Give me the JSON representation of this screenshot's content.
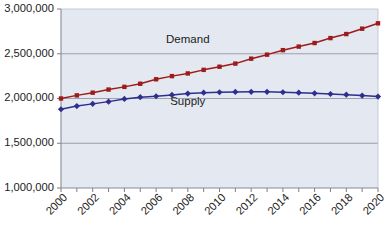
{
  "chart_data": {
    "type": "line",
    "title": "",
    "xlabel": "",
    "ylabel": "",
    "ylim": [
      1000000,
      3000000
    ],
    "xlim": [
      2000,
      2020
    ],
    "grid": true,
    "legend_position": "inline-annotation",
    "y_ticks": [
      1000000,
      1500000,
      2000000,
      2500000,
      3000000
    ],
    "y_tick_labels": [
      "1,000,000",
      "1,500,000",
      "2,000,000",
      "2,500,000",
      "3,000,000"
    ],
    "x": [
      2000,
      2001,
      2002,
      2003,
      2004,
      2005,
      2006,
      2007,
      2008,
      2009,
      2010,
      2011,
      2012,
      2013,
      2014,
      2015,
      2016,
      2017,
      2018,
      2019,
      2020
    ],
    "x_tick_labels": [
      "2000",
      "",
      "2002",
      "",
      "2004",
      "",
      "2006",
      "",
      "2008",
      "",
      "2010",
      "",
      "2012",
      "",
      "2014",
      "",
      "2016",
      "",
      "2018",
      "",
      "2020"
    ],
    "x_tick_labels_shown": [
      "2000",
      "2002",
      "2004",
      "2006",
      "2008",
      "2010",
      "2012",
      "2014",
      "2016",
      "2018",
      "2020"
    ],
    "series": [
      {
        "name": "Demand",
        "color": "#9e1b1b",
        "marker": "square",
        "annotation_x": 2008,
        "annotation_y": 2620000,
        "values": [
          2000000,
          2035000,
          2065000,
          2100000,
          2130000,
          2165000,
          2215000,
          2250000,
          2280000,
          2320000,
          2355000,
          2390000,
          2445000,
          2490000,
          2540000,
          2580000,
          2620000,
          2675000,
          2720000,
          2780000,
          2840000
        ]
      },
      {
        "name": "Supply",
        "color": "#2e2e8f",
        "marker": "diamond",
        "annotation_x": 2008,
        "annotation_y": 1930000,
        "values": [
          1880000,
          1915000,
          1940000,
          1965000,
          1995000,
          2015000,
          2025000,
          2040000,
          2055000,
          2065000,
          2070000,
          2073000,
          2075000,
          2075000,
          2070000,
          2065000,
          2058000,
          2050000,
          2043000,
          2033000,
          2022000
        ]
      }
    ]
  }
}
